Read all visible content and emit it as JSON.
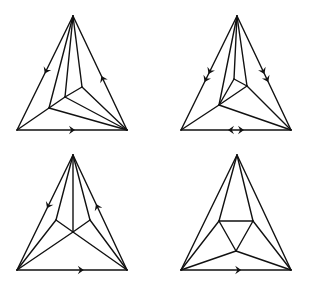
{
  "figure": {
    "width": 313,
    "height": 289,
    "stroke_color": "#111111",
    "background": "#ffffff",
    "panels": [
      {
        "id": "panel-top-left",
        "vertices": {
          "apex": [
            73,
            16
          ],
          "bl": [
            17,
            130
          ],
          "br": [
            127,
            130
          ],
          "a": [
            49,
            108
          ],
          "b": [
            65,
            97
          ],
          "c": [
            82,
            87
          ]
        },
        "edges": [
          [
            "apex",
            "bl"
          ],
          [
            "apex",
            "br"
          ],
          [
            "bl",
            "br"
          ],
          [
            "apex",
            "a"
          ],
          [
            "apex",
            "b"
          ],
          [
            "apex",
            "c"
          ],
          [
            "a",
            "bl"
          ],
          [
            "a",
            "b"
          ],
          [
            "b",
            "c"
          ],
          [
            "a",
            "br"
          ],
          [
            "b",
            "br"
          ],
          [
            "c",
            "br"
          ]
        ],
        "arrows": [
          {
            "edge": [
              "apex",
              "bl"
            ],
            "t": 0.48,
            "dir": "toward_end",
            "count": 1
          },
          {
            "edge": [
              "br",
              "apex"
            ],
            "t": 0.45,
            "dir": "toward_end",
            "count": 1
          },
          {
            "edge": [
              "bl",
              "br"
            ],
            "t": 0.5,
            "dir": "toward_end",
            "count": 1
          }
        ]
      },
      {
        "id": "panel-top-right",
        "vertices": {
          "apex": [
            237,
            16
          ],
          "bl": [
            181,
            130
          ],
          "br": [
            291,
            130
          ],
          "d": [
            219,
            105
          ],
          "e": [
            234,
            79
          ],
          "f": [
            247,
            86
          ]
        },
        "edges": [
          [
            "apex",
            "bl"
          ],
          [
            "apex",
            "br"
          ],
          [
            "bl",
            "br"
          ],
          [
            "apex",
            "d"
          ],
          [
            "apex",
            "e"
          ],
          [
            "apex",
            "f"
          ],
          [
            "d",
            "bl"
          ],
          [
            "d",
            "e"
          ],
          [
            "e",
            "f"
          ],
          [
            "d",
            "f"
          ],
          [
            "d",
            "br"
          ],
          [
            "f",
            "br"
          ]
        ],
        "arrows": [
          {
            "edge": [
              "apex",
              "bl"
            ],
            "t": 0.52,
            "dir": "toward_end",
            "count": 2
          },
          {
            "edge": [
              "apex",
              "br"
            ],
            "t": 0.52,
            "dir": "toward_end",
            "count": 2
          },
          {
            "edge": [
              "bl",
              "br"
            ],
            "t": 0.5,
            "dir": "outward_pair",
            "count": 2
          }
        ]
      },
      {
        "id": "panel-bottom-left",
        "vertices": {
          "apex": [
            73,
            155
          ],
          "bl": [
            17,
            270
          ],
          "br": [
            127,
            270
          ],
          "p": [
            56,
            220
          ],
          "q": [
            90,
            220
          ],
          "m": [
            73,
            232
          ]
        },
        "edges": [
          [
            "apex",
            "bl"
          ],
          [
            "apex",
            "br"
          ],
          [
            "bl",
            "br"
          ],
          [
            "apex",
            "p"
          ],
          [
            "apex",
            "m"
          ],
          [
            "apex",
            "q"
          ],
          [
            "p",
            "m"
          ],
          [
            "q",
            "m"
          ],
          [
            "p",
            "bl"
          ],
          [
            "q",
            "br"
          ],
          [
            "m",
            "bl"
          ],
          [
            "m",
            "br"
          ]
        ],
        "arrows": [
          {
            "edge": [
              "apex",
              "bl"
            ],
            "t": 0.44,
            "dir": "toward_end",
            "count": 1
          },
          {
            "edge": [
              "br",
              "apex"
            ],
            "t": 0.55,
            "dir": "toward_end",
            "count": 1
          },
          {
            "edge": [
              "bl",
              "br"
            ],
            "t": 0.58,
            "dir": "toward_end",
            "count": 1
          }
        ]
      },
      {
        "id": "panel-bottom-right",
        "vertices": {
          "apex": [
            237,
            155
          ],
          "bl": [
            181,
            270
          ],
          "br": [
            291,
            270
          ],
          "l": [
            219,
            221
          ],
          "r": [
            253,
            221
          ],
          "n": [
            236,
            251
          ]
        },
        "edges": [
          [
            "apex",
            "bl"
          ],
          [
            "apex",
            "br"
          ],
          [
            "bl",
            "br"
          ],
          [
            "apex",
            "l"
          ],
          [
            "apex",
            "r"
          ],
          [
            "l",
            "r"
          ],
          [
            "l",
            "n"
          ],
          [
            "r",
            "n"
          ],
          [
            "l",
            "bl"
          ],
          [
            "r",
            "br"
          ],
          [
            "n",
            "bl"
          ],
          [
            "n",
            "br"
          ]
        ],
        "arrows": [
          {
            "edge": [
              "bl",
              "br"
            ],
            "t": 0.52,
            "dir": "toward_end",
            "count": 1
          }
        ]
      }
    ]
  }
}
